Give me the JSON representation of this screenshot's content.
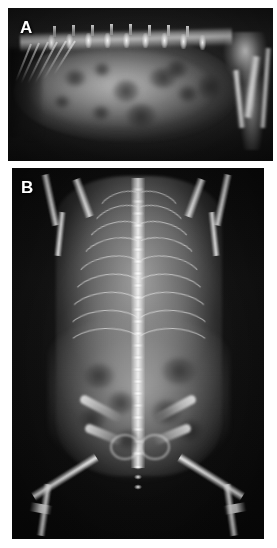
{
  "figure": {
    "type": "radiograph-figure",
    "panel_count": 2,
    "background_color": "#ffffff",
    "width": 277,
    "height": 548
  },
  "panels": [
    {
      "id": "panel-a",
      "label": "A",
      "view": "right lateral abdominal radiograph",
      "subject": "small animal (cat/ferret)",
      "modality": "x-ray",
      "orientation": "cranial-left, caudal-right",
      "background_color": "#121212",
      "bone_color": "#f5f5f5",
      "soft_tissue_color": "#9a9a9a",
      "bounds": {
        "x": 8,
        "y": 8,
        "width": 265,
        "height": 153
      },
      "features": [
        "lumbar vertebral column with dorsal spinous processes",
        "caudal rib arcs cranially",
        "distended rounded abdominal soft-tissue mass",
        "mottled mixed-opacity visceral pattern",
        "gas-filled bowel loops as dark foci",
        "pelvis and femur overlying caudal field"
      ]
    },
    {
      "id": "panel-b",
      "label": "B",
      "view": "ventrodorsal (VD) whole-body radiograph",
      "subject": "small animal (cat/ferret)",
      "modality": "x-ray",
      "orientation": "cranial-top, caudal-bottom",
      "background_color": "#0b0b0b",
      "bone_color": "#fafafa",
      "soft_tissue_color": "#a5a5a5",
      "bounds": {
        "x": 12,
        "y": 168,
        "width": 252,
        "height": 371
      },
      "features": [
        "midline vertebral column, thoracic through lumbar",
        "symmetric bilateral rib cage",
        "forelimbs extended cranially with humeri and scapulae",
        "widened rounded abdominal silhouette",
        "pelvis with iliac wings and obturator foramina",
        "bilateral femurs abducted, stifles at image margin",
        "mottled abdominal visceral detail"
      ]
    }
  ],
  "labels": {
    "panel_a": "A",
    "panel_b": "B"
  }
}
